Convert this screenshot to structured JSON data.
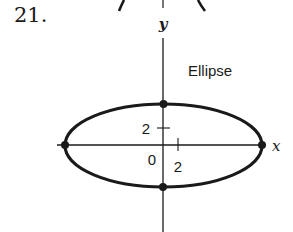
{
  "problem": {
    "number": "21."
  },
  "diagram": {
    "title": "Ellipse",
    "axes": {
      "x_label": "x",
      "y_label": "y"
    },
    "ticks": {
      "origin": "0",
      "x_tick": "2",
      "y_tick": "2"
    },
    "vertices": [
      "top",
      "bottom",
      "left",
      "right"
    ],
    "colors": {
      "ink": "#1a1a1a",
      "background": "#ffffff"
    }
  }
}
